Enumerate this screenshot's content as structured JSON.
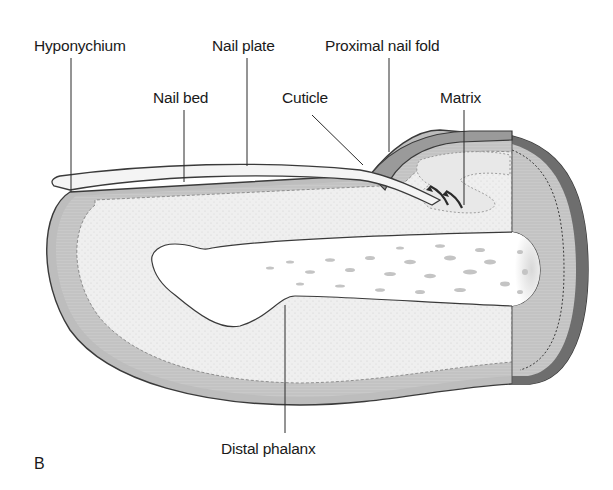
{
  "figure": {
    "panel_letter": "B",
    "labels": {
      "hyponychium": "Hyponychium",
      "nail_plate": "Nail plate",
      "nail_bed": "Nail bed",
      "cuticle": "Cuticle",
      "proximal_nail_fold": "Proximal nail fold",
      "matrix": "Matrix",
      "distal_phalanx": "Distal phalanx"
    },
    "colors": {
      "outline": "#3a3a3a",
      "skin_outer": "#b8b8b8",
      "dermis": "#eeeeee",
      "epidermis_band": "#d4d4d4",
      "proximal_section": "#c8c8c8",
      "proximal_rim": "#6e6e6e",
      "bone": "#ffffff",
      "nail_plate": "#f4f4f4"
    }
  }
}
